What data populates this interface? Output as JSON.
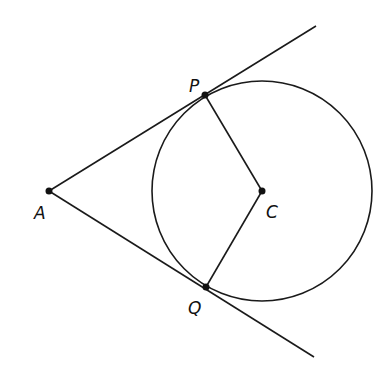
{
  "diagram": {
    "colors": {
      "stroke": "#1a1a1a",
      "background": "#ffffff"
    },
    "circle": {
      "center": "C",
      "cx": 262,
      "cy": 191,
      "r": 110
    },
    "points": [
      {
        "name": "A",
        "x": 49,
        "y": 191,
        "label": "A",
        "lx": 36,
        "ly": 219
      },
      {
        "name": "P",
        "x": 205,
        "y": 95,
        "label": "P",
        "lx": 190,
        "ly": 92
      },
      {
        "name": "C",
        "x": 262,
        "y": 191,
        "label": "C",
        "lx": 266,
        "ly": 218
      },
      {
        "name": "Q",
        "x": 206,
        "y": 287,
        "label": "Q",
        "lx": 189,
        "ly": 313
      }
    ],
    "segments": [
      {
        "name": "tangent-AP-ray",
        "from": [
          49,
          191
        ],
        "to": [
          316,
          26
        ]
      },
      {
        "name": "tangent-AQ-ray",
        "from": [
          49,
          191
        ],
        "to": [
          314,
          357
        ]
      },
      {
        "name": "radius-CP",
        "from": [
          262,
          191
        ],
        "to": [
          205,
          95
        ]
      },
      {
        "name": "radius-CQ",
        "from": [
          262,
          191
        ],
        "to": [
          206,
          287
        ]
      }
    ]
  }
}
